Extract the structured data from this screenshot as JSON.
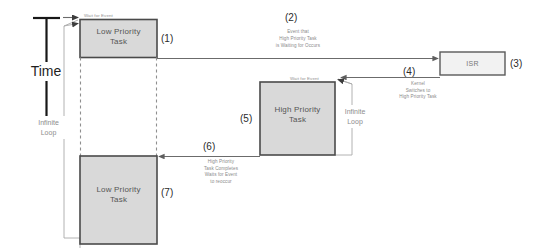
{
  "diagram": {
    "axis": {
      "label": "Time",
      "direction": "downward"
    },
    "colors": {
      "task_box_fill": "#d9d9d9",
      "task_box_stroke": "#4a4a4a",
      "isr_box_fill": "#f2f2f2",
      "isr_box_stroke": "#5a5a5a",
      "line": "#6b6b6b",
      "dashed_line": "#8f8f8f",
      "annotation_text": "#8a8a8a",
      "background": "#ffffff"
    },
    "boxes": [
      {
        "id": "low-priority-task-top",
        "line1": "Low Priority",
        "line2": "Task",
        "step": "(1)"
      },
      {
        "id": "isr",
        "line1": "ISR",
        "line2": "",
        "step": "(3)"
      },
      {
        "id": "high-priority-task",
        "line1": "High Priority",
        "line2": "Task",
        "step": "(5)"
      },
      {
        "id": "low-priority-task-bottom",
        "line1": "Low Priority",
        "line2": "Task",
        "step": "(7)"
      }
    ],
    "annotations": [
      {
        "id": "event-occurs",
        "step": "(2)",
        "lines": [
          "Event that",
          "High Priority Task",
          "is Waiting for Occurs"
        ]
      },
      {
        "id": "kernel-switch",
        "step": "(4)",
        "lines": [
          "Kernel",
          "Switches to",
          "High Priority Task"
        ]
      },
      {
        "id": "task-completes",
        "step": "(6)",
        "lines": [
          "High Priority",
          "Task Completes",
          "Waits for Event",
          "to reoccur"
        ]
      }
    ],
    "wait_labels": [
      {
        "id": "wait-low-priority",
        "text": "Wait for Event"
      },
      {
        "id": "wait-high-priority",
        "text": "Wait for Event"
      }
    ],
    "loop_labels": [
      {
        "id": "infinite-loop-low",
        "line1": "Infinite",
        "line2": "Loop"
      },
      {
        "id": "infinite-loop-high",
        "line1": "Infinite",
        "line2": "Loop"
      }
    ]
  }
}
